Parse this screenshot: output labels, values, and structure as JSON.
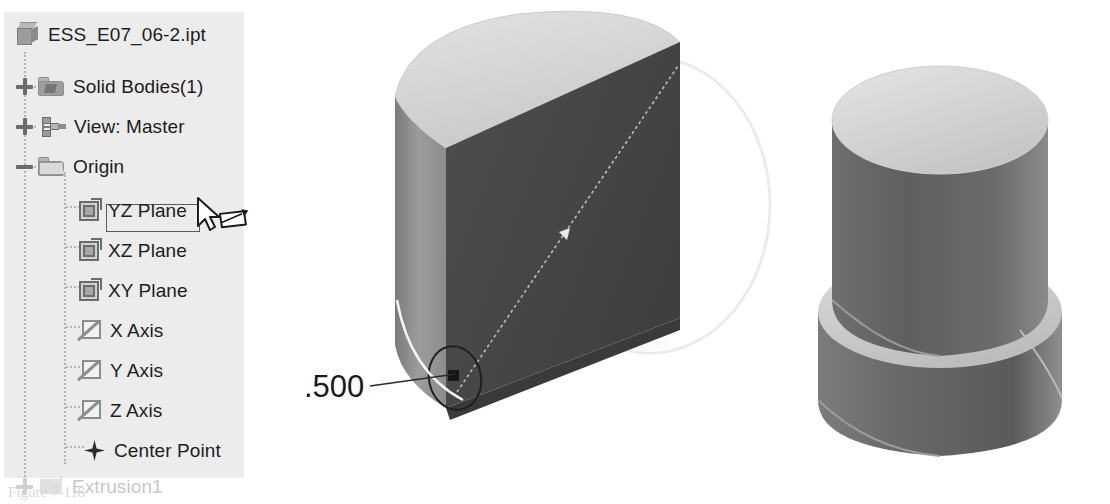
{
  "app": {
    "panel_title": "Model Browser"
  },
  "tree": {
    "items": [
      {
        "label": "ESS_E07_06-2.ipt",
        "icon": "part-cube-icon",
        "depth": 0,
        "toggle": "none",
        "state": "normal"
      },
      {
        "label": "Solid Bodies(1)",
        "icon": "solid-bodies-folder-icon",
        "depth": 1,
        "toggle": "plus",
        "state": "normal"
      },
      {
        "label": "View: Master",
        "icon": "view-representation-icon",
        "depth": 1,
        "toggle": "plus",
        "state": "normal"
      },
      {
        "label": "Origin",
        "icon": "origin-folder-icon",
        "depth": 1,
        "toggle": "minus",
        "state": "normal"
      },
      {
        "label": "YZ Plane",
        "icon": "origin-plane-icon",
        "depth": 2,
        "toggle": "none",
        "state": "editing"
      },
      {
        "label": "XZ Plane",
        "icon": "origin-plane-icon",
        "depth": 2,
        "toggle": "none",
        "state": "normal"
      },
      {
        "label": "XY Plane",
        "icon": "origin-plane-icon",
        "depth": 2,
        "toggle": "none",
        "state": "normal"
      },
      {
        "label": "X Axis",
        "icon": "origin-axis-icon",
        "depth": 2,
        "toggle": "none",
        "state": "normal"
      },
      {
        "label": "Y Axis",
        "icon": "origin-axis-icon",
        "depth": 2,
        "toggle": "none",
        "state": "normal"
      },
      {
        "label": "Z Axis",
        "icon": "origin-axis-icon",
        "depth": 2,
        "toggle": "none",
        "state": "normal"
      },
      {
        "label": "Center Point",
        "icon": "center-point-icon",
        "depth": 2,
        "toggle": "none",
        "state": "normal"
      },
      {
        "label": "Extrusion1",
        "icon": "extrusion-feature-icon",
        "depth": 1,
        "toggle": "plus",
        "state": "clipped"
      }
    ],
    "rename_value": "YZ Plane",
    "cursor": "arrow-with-rename-pencil"
  },
  "viewport": {
    "dimension_label": ".500",
    "models": [
      {
        "name": "half-cylinder-section-model",
        "note": "cylinder cut by YZ plane, sketch circle visible"
      },
      {
        "name": "stepped-cylinder-model",
        "note": "two-diameter stepped cylindrical part"
      }
    ]
  },
  "caption": {
    "text": "Figure 7-118"
  },
  "colors": {
    "panel_bg": "#ececec",
    "text": "#1d1d1d",
    "connector": "#b4b4b4",
    "model_dark": "#4b4b4b",
    "model_light": "#d6d6d6",
    "model_mid": "#8e8e8e"
  }
}
